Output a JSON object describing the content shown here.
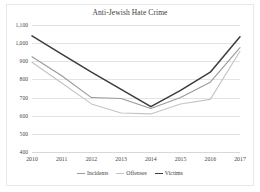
{
  "figure": {
    "title": "Anti-Jewish Hate Crime"
  },
  "axes": {
    "y_ticks": [
      "1,100",
      "1,000",
      "900",
      "800",
      "700",
      "600",
      "500",
      "400"
    ],
    "x_ticks": [
      "2010",
      "2011",
      "2012",
      "2013",
      "2014",
      "2015",
      "2016",
      "2017"
    ]
  },
  "legend": {
    "items": [
      {
        "label": "Incidents",
        "color": "#9a9a9a"
      },
      {
        "label": "Offenses",
        "color": "#c4c4c4"
      },
      {
        "label": "Victims",
        "color": "#3c3c3c"
      }
    ]
  },
  "chart_data": {
    "type": "line",
    "title": "Anti-Jewish Hate Crime",
    "xlabel": "",
    "ylabel": "",
    "categories": [
      "2010",
      "2011",
      "2012",
      "2013",
      "2014",
      "2015",
      "2016",
      "2017"
    ],
    "ylim": [
      400,
      1100
    ],
    "y_ticks": [
      1100,
      1000,
      900,
      800,
      700,
      600,
      500,
      400
    ],
    "grid": true,
    "legend_position": "bottom",
    "series": [
      {
        "name": "Incidents",
        "color": "#9a9a9a",
        "values": [
          925,
          820,
          700,
          695,
          640,
          700,
          785,
          975
        ]
      },
      {
        "name": "Offenses",
        "color": "#c4c4c4",
        "values": [
          895,
          780,
          665,
          615,
          610,
          665,
          690,
          955
        ]
      },
      {
        "name": "Victims",
        "color": "#3c3c3c",
        "values": [
          1040,
          940,
          840,
          745,
          650,
          740,
          840,
          1035
        ]
      }
    ]
  }
}
